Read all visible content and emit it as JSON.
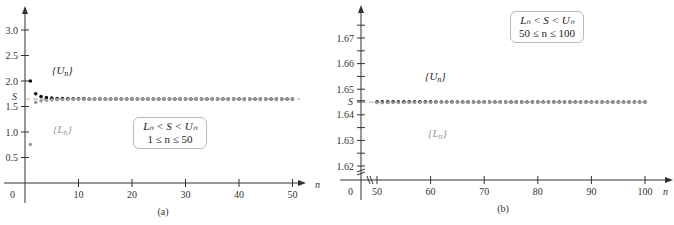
{
  "chart_data": [
    {
      "type": "scatter",
      "panel": "(a)",
      "title": "",
      "xlabel": "n",
      "ylabel": "",
      "xlim": [
        0,
        52
      ],
      "ylim": [
        0,
        3.3
      ],
      "x_ticks": [
        10,
        20,
        30,
        40,
        50
      ],
      "y_ticks": [
        0.5,
        1.0,
        1.5,
        2.0,
        2.5,
        3.0
      ],
      "y_tick_labels": [
        "0.5",
        "1.0",
        "1.5",
        "2.0",
        "2.5",
        "3.0"
      ],
      "origin_label": "0",
      "reference_line": {
        "label": "S",
        "value": 1.6449,
        "style": "dashed"
      },
      "annotation_box": [
        "L_n < S < U_n",
        "1 ≤ n ≤ 50"
      ],
      "series": [
        {
          "name": "{U_n}",
          "color": "#111111",
          "n_range": [
            1,
            50
          ],
          "formula": "S_n + 1/n",
          "sample_values": {
            "1": 2.0,
            "2": 1.75,
            "3": 1.694,
            "5": 1.664,
            "10": 1.65,
            "50": 1.645
          }
        },
        {
          "name": "{L_n}",
          "color": "#999999",
          "n_range": [
            1,
            50
          ],
          "formula": "S_n + 1/(n+1)",
          "sample_values": {
            "1": 1.5,
            "2": 1.583,
            "3": 1.611,
            "5": 1.63,
            "10": 1.64,
            "50": 1.6446
          }
        }
      ],
      "grid": false
    },
    {
      "type": "scatter",
      "panel": "(b)",
      "title": "",
      "xlabel": "n",
      "ylabel": "",
      "xlim": [
        48,
        102
      ],
      "ylim": [
        1.617,
        1.675
      ],
      "axis_break": true,
      "x_ticks": [
        50,
        60,
        70,
        80,
        90,
        100
      ],
      "y_ticks": [
        1.62,
        1.63,
        1.64,
        1.65,
        1.66,
        1.67
      ],
      "y_tick_labels": [
        "1.62",
        "1.63",
        "1.64",
        "1.65",
        "1.66",
        "1.67"
      ],
      "origin_label": "0",
      "reference_line": {
        "label": "S",
        "value": 1.6449,
        "style": "dashed"
      },
      "annotation_box": [
        "L_n < S < U_n",
        "50 ≤ n ≤ 100"
      ],
      "series": [
        {
          "name": "{U_n}",
          "color": "#111111",
          "n_range": [
            50,
            100
          ],
          "sample_values": {
            "50": 1.6637,
            "60": 1.6612,
            "70": 1.6592,
            "80": 1.658,
            "90": 1.6566,
            "100": 1.655
          }
        },
        {
          "name": "{L_n}",
          "color": "#999999",
          "n_range": [
            50,
            100
          ],
          "sample_values": {
            "50": 1.6245,
            "60": 1.6278,
            "70": 1.6302,
            "80": 1.632,
            "90": 1.6335,
            "100": 1.635
          }
        }
      ],
      "grid": false
    }
  ],
  "panel_a": {
    "caption": "(a)",
    "origin": "0",
    "x_axis_name": "n",
    "s_label": "S",
    "u_label": "{U",
    "u_sub": "n",
    "l_label": "{L",
    "l_sub": "n",
    "box_line1": "Lₙ < S < Uₙ",
    "box_line2": "1 ≤ n ≤ 50"
  },
  "panel_b": {
    "caption": "(b)",
    "origin": "0",
    "x_axis_name": "n",
    "s_label": "S",
    "u_label": "{U",
    "u_sub": "n",
    "l_label": "{L",
    "l_sub": "n",
    "box_line1": "Lₙ < S < Uₙ",
    "box_line2": "50 ≤ n ≤ 100"
  },
  "colors": {
    "upper": "#111111",
    "lower": "#999999",
    "axis": "#333333",
    "dashed": "#aaaaaa"
  }
}
